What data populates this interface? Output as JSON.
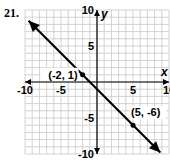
{
  "problem": {
    "number": "21."
  },
  "chart_data": {
    "type": "line",
    "title": "",
    "xlabel": "x",
    "ylabel": "y",
    "xlim": [
      -10,
      10
    ],
    "ylim": [
      -10,
      10
    ],
    "grid": true,
    "x_ticks": [
      "-10",
      "-5",
      "5",
      "10"
    ],
    "y_ticks": [
      "10",
      "5",
      "-5",
      "-10"
    ],
    "series": [
      {
        "name": "line",
        "equation": "y = -x - 1",
        "arrows": "both",
        "x": [
          -10,
          10
        ],
        "y": [
          9,
          -11
        ]
      }
    ],
    "points": [
      {
        "x": -2,
        "y": 1,
        "label": "(-2, 1)"
      },
      {
        "x": 5,
        "y": -6,
        "label": "(5, -6)"
      }
    ],
    "colors": {
      "line": "#000000",
      "grid": "#c8c8c8",
      "axis": "#000000"
    }
  }
}
